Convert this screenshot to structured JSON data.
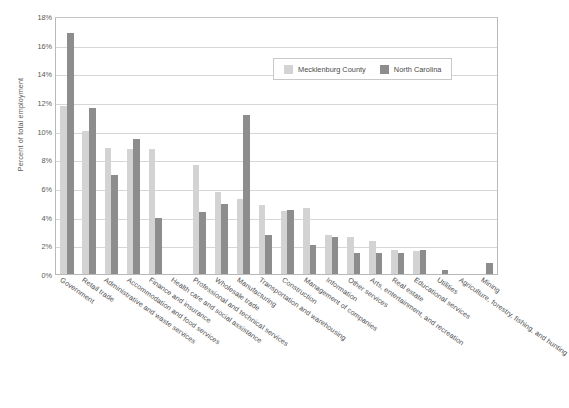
{
  "chart_data": {
    "type": "bar",
    "title": "",
    "xlabel": "",
    "ylabel": "Percent of total employment",
    "ylim": [
      0,
      18
    ],
    "ytick_labels": [
      "18%",
      "16%",
      "14%",
      "12%",
      "10%",
      "8%",
      "6%",
      "4%",
      "2%",
      "0%"
    ],
    "ytick_values": [
      18,
      16,
      14,
      12,
      10,
      8,
      6,
      4,
      2,
      0
    ],
    "grid": true,
    "legend_position": "top-right-inside",
    "categories": [
      "Government",
      "Retail trade",
      "Administrative and waste services",
      "Accommodation and food services",
      "Finance and insurance",
      "Health care and social assistance",
      "Professional and technical services",
      "Wholesale trade",
      "Manufacturing",
      "Transportation and warehousing",
      "Construction",
      "Management of companies",
      "Information",
      "Other services",
      "Arts, entertainment, and recreation",
      "Real estate",
      "Educational services",
      "Utilities",
      "Agriculture, forestry, fishing, and hunting",
      "Mining"
    ],
    "series": [
      {
        "name": "Mecklenburg County",
        "color": "#d3d3d3",
        "values": [
          11.7,
          10.0,
          8.8,
          8.7,
          8.7,
          0,
          7.6,
          5.7,
          5.2,
          4.8,
          4.4,
          4.6,
          2.7,
          2.6,
          2.3,
          1.7,
          1.6,
          0,
          0,
          0
        ]
      },
      {
        "name": "North Carolina",
        "color": "#8d8d8d",
        "values": [
          16.8,
          11.6,
          6.9,
          9.4,
          3.9,
          0,
          4.3,
          4.9,
          11.1,
          2.7,
          4.5,
          2.0,
          2.6,
          1.5,
          1.5,
          1.5,
          1.7,
          0.3,
          0,
          0.8
        ]
      }
    ]
  },
  "legend": {
    "entries": [
      {
        "label": "Mecklenburg County",
        "color": "#d3d3d3",
        "swatch_name": "legend-swatch-mecklenburg"
      },
      {
        "label": "North Carolina",
        "color": "#8d8d8d",
        "swatch_name": "legend-swatch-north-carolina"
      }
    ]
  }
}
